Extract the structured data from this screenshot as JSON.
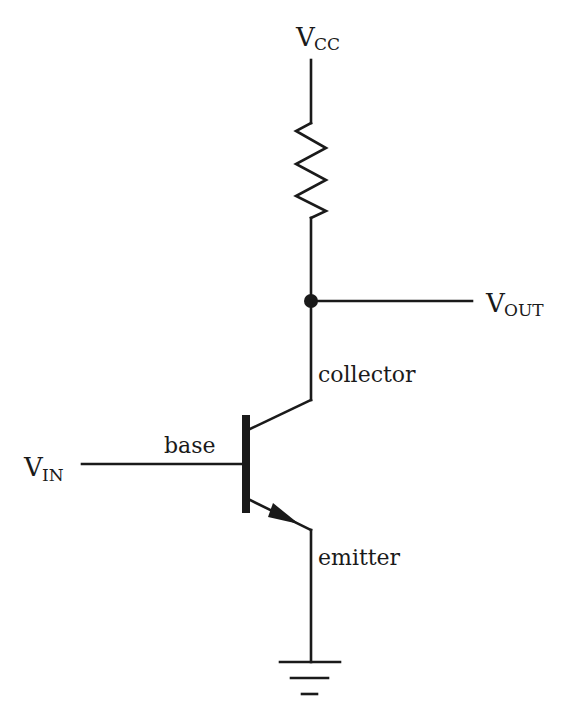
{
  "diagram": {
    "type": "circuit-schematic",
    "labels": {
      "vcc": {
        "main": "V",
        "sub": "CC"
      },
      "vout": {
        "main": "V",
        "sub": "OUT"
      },
      "vin": {
        "main": "V",
        "sub": "IN"
      },
      "collector": "collector",
      "base": "base",
      "emitter": "emitter"
    },
    "components": [
      "supply-vcc",
      "resistor",
      "output-node",
      "npn-transistor",
      "ground"
    ],
    "colors": {
      "line": "#1a1a1a",
      "background": "#ffffff"
    }
  }
}
